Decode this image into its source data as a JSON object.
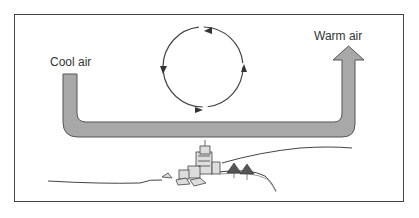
{
  "diagram": {
    "type": "air circulation diagram",
    "labels": {
      "left": "Cool air",
      "right": "Warm air"
    },
    "colors": {
      "tube_fill": "#a8a8a8",
      "tube_stroke": "#555555",
      "line": "#444444",
      "background": "#ffffff"
    },
    "elements": [
      "U-shaped flow arrow from cool air (left) to warm air (right)",
      "circular arrows indicating rotation",
      "city skyline with trees on hill",
      "ground line"
    ]
  }
}
